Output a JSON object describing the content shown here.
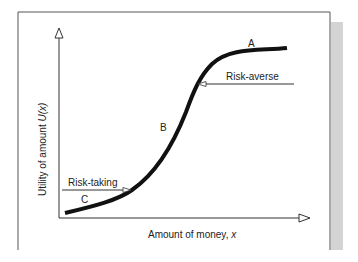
{
  "diagram": {
    "title": "",
    "y_axis_label_prefix": "Utility of amount ",
    "y_axis_label_var": "U(x)",
    "x_axis_label_prefix": "Amount of money, ",
    "x_axis_label_var": "x",
    "points": {
      "a": "A",
      "b": "B",
      "c": "C"
    },
    "annotations": {
      "risk_averse": "Risk-averse",
      "risk_taking": "Risk-taking"
    },
    "colors": {
      "curve": "#111111",
      "axis": "#333333",
      "shadow": "#d4d4d4"
    }
  }
}
